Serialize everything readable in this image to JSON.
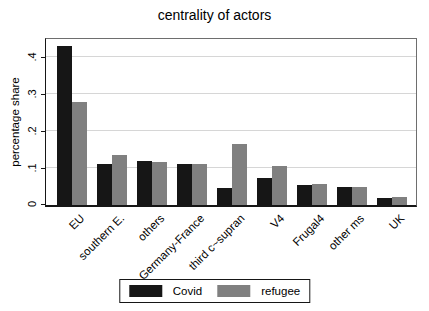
{
  "chart_data": {
    "type": "bar",
    "title": "centrality of actors",
    "xlabel": "",
    "ylabel": "percentage share",
    "categories": [
      "EU",
      "southern E.",
      "others",
      "Germany-France",
      "third c~supran",
      "V4",
      "Frugal4",
      "other ms",
      "UK"
    ],
    "series": [
      {
        "name": "Covid",
        "color": "#161616",
        "values": [
          0.43,
          0.112,
          0.118,
          0.112,
          0.046,
          0.072,
          0.054,
          0.049,
          0.02
        ]
      },
      {
        "name": "refugee",
        "color": "#808080",
        "values": [
          0.28,
          0.135,
          0.117,
          0.11,
          0.165,
          0.106,
          0.057,
          0.049,
          0.023
        ]
      }
    ],
    "ylim": [
      0,
      0.45
    ],
    "yticks": [
      0,
      0.1,
      0.2,
      0.3,
      0.4
    ],
    "ytick_labels": [
      "0",
      ".1",
      ".2",
      ".3",
      ".4"
    ],
    "grid": true,
    "legend_position": "bottom-center",
    "plot_background": "#ffffff",
    "gridline_color": "#d6d6d6"
  }
}
